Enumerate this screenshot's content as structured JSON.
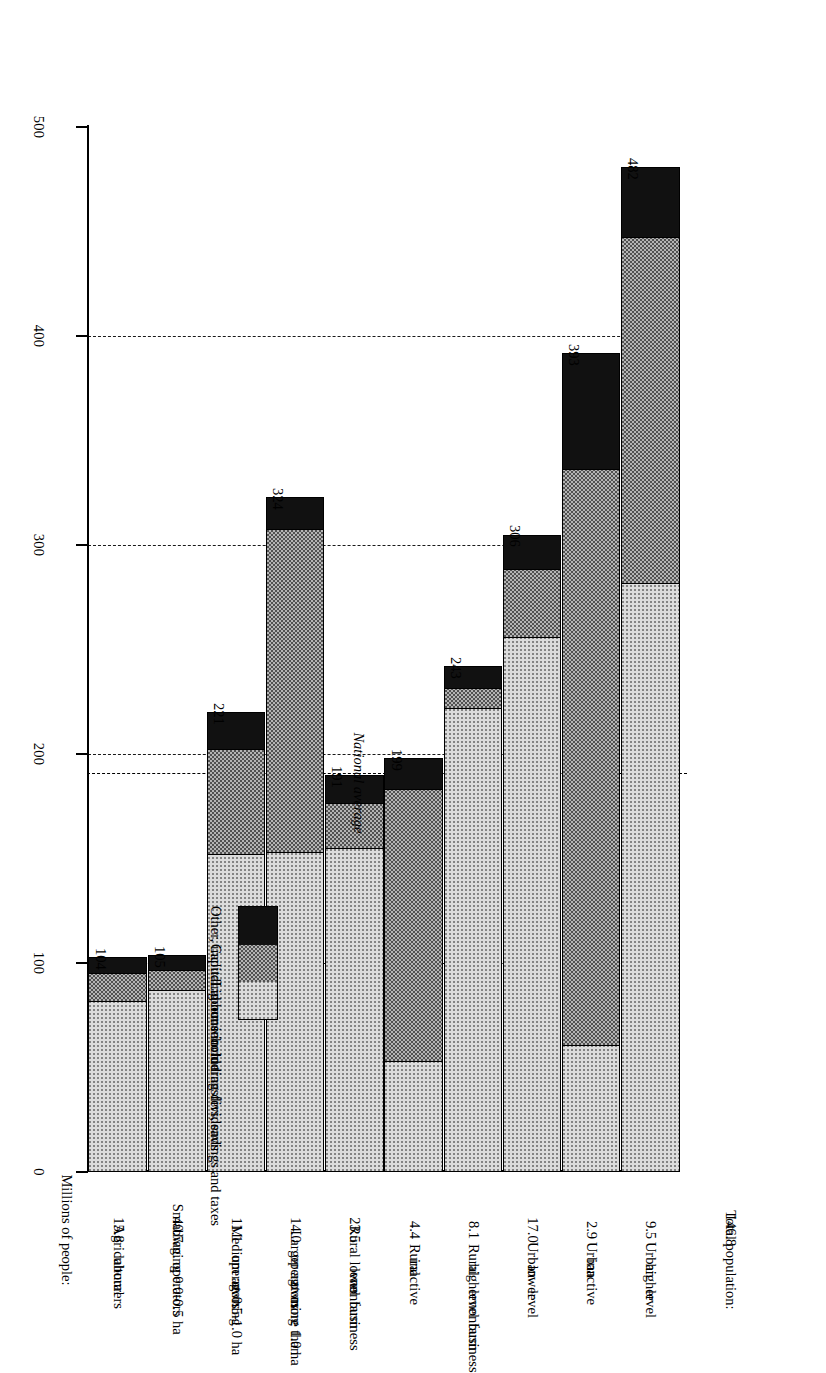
{
  "chart_data": {
    "type": "bar",
    "title": "",
    "subtitle": "",
    "orientation": "horizontal-rotated",
    "stacked": true,
    "xlabel": "",
    "ylabel": "Average per capita income (Rs '000)",
    "ylim": [
      0,
      500
    ],
    "yticks": [
      0,
      100,
      200,
      300,
      400,
      500
    ],
    "ytick_labels": [
      "0",
      "100",
      "200",
      "300",
      "400",
      "500"
    ],
    "grid": "dashed gridlines at 100,200,300,400",
    "legend_position": "inside-left",
    "categories": [
      "Agricultural labourers",
      "Small ag. operators owning 0.0-0.5 ha",
      "Medium ag. operators owning 0.5-1.0 ha",
      "Larger ag. operators owning more than 1.0 ha",
      "Rural lower level nonfarm business",
      "Rural inactive",
      "Rural higher level nonfarm business",
      "Urban lower level",
      "Urban inactive",
      "Urban higher level"
    ],
    "category_lines": [
      [
        "Agricultural",
        "labourers"
      ],
      [
        "Small  ag.  operators",
        "owning 0.0-0.5 ha"
      ],
      [
        "Medium ag.",
        "operators",
        "owning",
        "0.5-1.0 ha"
      ],
      [
        "Larger ag.",
        "operators",
        "owning",
        "more than",
        "1.0 ha"
      ],
      [
        "Rural  lower",
        "level",
        "nonfarm",
        "business"
      ],
      [
        "Rural",
        "inactive"
      ],
      [
        "Rural",
        "higher",
        "level",
        "nonfarm",
        "business"
      ],
      [
        "Urban",
        "lower",
        "level"
      ],
      [
        "Urban",
        "inactive"
      ],
      [
        "Urban",
        "higher",
        "level"
      ]
    ],
    "population_header": "Millions of people:",
    "population_total_label": "Total population:",
    "population_total": "146.8",
    "population": [
      "15.8",
      "40.7",
      "11.1",
      "14.0",
      "23.5",
      "4.4",
      "8.1",
      "17.0",
      "2.9",
      "9.5"
    ],
    "totals": [
      104,
      105,
      221,
      324,
      191,
      199,
      243,
      306,
      393,
      482
    ],
    "total_labels": [
      "104",
      "105",
      "221",
      "324",
      "191",
      "199",
      "243",
      "306",
      "393",
      "482"
    ],
    "series": [
      {
        "name": "Labour income",
        "key": "labour",
        "values": [
          82,
          87,
          152,
          153,
          155,
          53,
          222,
          256,
          61,
          282
        ]
      },
      {
        "name": "Capital income including dividends",
        "key": "capital",
        "values": [
          14,
          10,
          51,
          155,
          22,
          131,
          10,
          33,
          276,
          166
        ]
      },
      {
        "name": "Other, including household transfers, savings and taxes",
        "key": "other",
        "values": [
          8,
          8,
          18,
          16,
          14,
          15,
          11,
          17,
          56,
          34
        ]
      }
    ],
    "annotations": [
      {
        "text": "National average",
        "value": 191,
        "style": "dash-dot"
      }
    ],
    "legend_entries": [
      "Other, including household transfers, savings and taxes",
      "Capital income including dividends",
      "Labour income"
    ],
    "colors": {
      "other": "#111111",
      "capital": "#b4b4b4",
      "labour": "#dcdcdc",
      "axis": "#000000",
      "gridline": "#1a1a1a"
    }
  }
}
